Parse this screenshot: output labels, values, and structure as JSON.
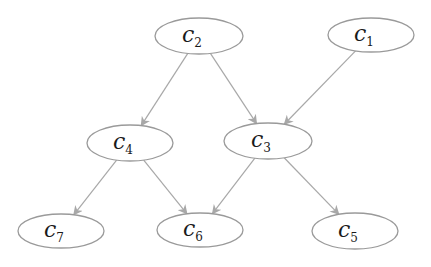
{
  "diagram": {
    "type": "directed-graph",
    "nodes": [
      {
        "id": "c2",
        "base": "c",
        "sub": "2",
        "cx": 199,
        "cy": 36,
        "rx": 44,
        "ry": 18
      },
      {
        "id": "c1",
        "base": "c",
        "sub": "1",
        "cx": 371,
        "cy": 35,
        "rx": 43,
        "ry": 17
      },
      {
        "id": "c4",
        "base": "c",
        "sub": "4",
        "cx": 130,
        "cy": 143,
        "rx": 43,
        "ry": 18
      },
      {
        "id": "c3",
        "base": "c",
        "sub": "3",
        "cx": 268,
        "cy": 141,
        "rx": 44,
        "ry": 18
      },
      {
        "id": "c7",
        "base": "c",
        "sub": "7",
        "cx": 61,
        "cy": 231,
        "rx": 43,
        "ry": 17
      },
      {
        "id": "c6",
        "base": "c",
        "sub": "6",
        "cx": 200,
        "cy": 230,
        "rx": 43,
        "ry": 17
      },
      {
        "id": "c5",
        "base": "c",
        "sub": "5",
        "cx": 355,
        "cy": 231,
        "rx": 43,
        "ry": 18
      }
    ],
    "edges": [
      {
        "from": "c2",
        "to": "c4"
      },
      {
        "from": "c2",
        "to": "c3"
      },
      {
        "from": "c1",
        "to": "c3"
      },
      {
        "from": "c4",
        "to": "c7"
      },
      {
        "from": "c4",
        "to": "c6"
      },
      {
        "from": "c3",
        "to": "c6"
      },
      {
        "from": "c3",
        "to": "c5"
      }
    ],
    "colors": {
      "node_stroke": "#9a9a9a",
      "edge": "#a8a8a8",
      "text": "#1a1a1a"
    }
  }
}
